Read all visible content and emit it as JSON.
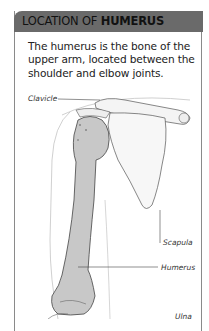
{
  "header": {
    "title_light": "LOCATION OF ",
    "title_bold": "HUMERUS"
  },
  "intro": {
    "text": "The humerus is the bone of the upper arm, located between the shoulder and elbow joints."
  },
  "illustration": {
    "labels": {
      "clavicle": "Clavicle",
      "scapula": "Scapula",
      "humerus": "Humerus",
      "ulna": "Ulna"
    }
  },
  "colors": {
    "header_bg": "#6a6a6a",
    "border": "#8a8a8a",
    "bone_fill": "#c8c8c8"
  }
}
